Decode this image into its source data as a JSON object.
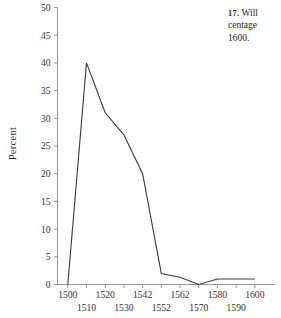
{
  "caption": {
    "number": "17.",
    "line1": "Will",
    "line2": "centage",
    "line3": "1600."
  },
  "chart_data": {
    "type": "line",
    "title": "",
    "xlabel": "",
    "ylabel": "Percent",
    "ylim": [
      0,
      50
    ],
    "xlim": [
      1495,
      1605
    ],
    "grid": false,
    "legend": false,
    "y_ticks": [
      0,
      5,
      10,
      15,
      20,
      25,
      30,
      35,
      40,
      45,
      50
    ],
    "y_tick_labels": [
      "0",
      "5",
      "10",
      "15",
      "20",
      "25",
      "30",
      "35",
      "40",
      "45",
      "50"
    ],
    "x_tick_labels": [
      "1500",
      "1510",
      "1520",
      "1530",
      "1542",
      "1552",
      "1562",
      "1570",
      "1580",
      "1590",
      "1600"
    ],
    "x_tick_rows": [
      0,
      1,
      0,
      1,
      0,
      1,
      0,
      1,
      0,
      1,
      0
    ],
    "x": [
      1500,
      1510,
      1520,
      1530,
      1542,
      1552,
      1562,
      1570,
      1580,
      1590,
      1600
    ],
    "values": [
      0,
      40,
      31,
      27,
      20,
      2,
      1.3,
      0,
      1,
      1,
      1
    ],
    "series": [
      {
        "name": "Percent",
        "values": [
          0,
          40,
          31,
          27,
          20,
          2,
          1.3,
          0,
          1,
          1,
          1
        ]
      }
    ]
  },
  "colors": {
    "line": "#3a3a3a",
    "axis": "#8a8a8a",
    "text": "#333333",
    "background": "#ffffff"
  }
}
